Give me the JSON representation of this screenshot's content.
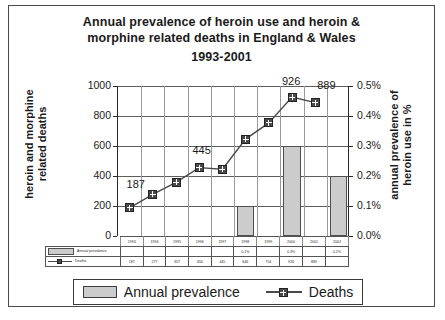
{
  "chart_data": {
    "type": "bar",
    "title": "Annual prevalence of heroin use and heroin & morphine related deaths in England & Wales 1993-2001",
    "title_lines": [
      "Annual prevalence of heroin use and heroin &",
      "morphine related deaths in England & Wales",
      "1993-2001"
    ],
    "xlabel": "",
    "categories": [
      "1993",
      "1994",
      "1995",
      "1996",
      "1997",
      "1998",
      "1999",
      "2000",
      "2001",
      "2002"
    ],
    "series": [
      {
        "name": "Annual prevalence",
        "type": "bar",
        "axis": "right",
        "unit": "%",
        "values": [
          null,
          null,
          null,
          null,
          null,
          0.1,
          null,
          0.3,
          null,
          0.2
        ],
        "labels": [
          "",
          "",
          "",
          "",
          "",
          "0.1%",
          "",
          "0.3%",
          "",
          "0.2%"
        ],
        "color": "#cccccc"
      },
      {
        "name": "Deaths",
        "type": "line",
        "axis": "left",
        "values": [
          187,
          277,
          357,
          456,
          445,
          646,
          754,
          926,
          889,
          null
        ],
        "labels": [
          "187",
          "277",
          "357",
          "456",
          "445",
          "646",
          "754",
          "926",
          "889",
          ""
        ],
        "color": "#4a4a4a"
      }
    ],
    "annotations": [
      {
        "text": "187",
        "series": "Deaths",
        "category": "1993",
        "value": 187
      },
      {
        "text": "445",
        "series": "Deaths",
        "category": "1997",
        "value": 445
      },
      {
        "text": "926",
        "series": "Deaths",
        "category": "2000",
        "value": 926
      },
      {
        "text": "889",
        "series": "Deaths",
        "category": "2001",
        "value": 889
      }
    ],
    "left_axis": {
      "ylabel": "heroin and morphine related deaths",
      "ylabel_lines": [
        "heroin and morphine",
        "related deaths"
      ],
      "ylim": [
        0,
        1000
      ],
      "ticks": [
        "1000",
        "800",
        "600",
        "400",
        "200",
        "0"
      ],
      "tick_values": [
        1000,
        800,
        600,
        400,
        200,
        0
      ]
    },
    "right_axis": {
      "ylabel": "annual prevalence of heroin use in %",
      "ylabel_lines": [
        "annual prevalence of",
        "heroin use in %"
      ],
      "ylim": [
        0,
        0.5
      ],
      "ticks": [
        "0.5%",
        "0.4%",
        "0.3%",
        "0.2%",
        "0.1%",
        "0.0%"
      ],
      "tick_values": [
        0.5,
        0.4,
        0.3,
        0.2,
        0.1,
        0.0
      ]
    },
    "grid": true,
    "legend_position": "bottom",
    "legend": [
      "Annual prevalence",
      "Deaths"
    ]
  },
  "table": {
    "years": [
      "1993",
      "1994",
      "1995",
      "1996",
      "1997",
      "1998",
      "1999",
      "2000",
      "2001",
      "2002"
    ],
    "rows": [
      {
        "label": "Annual prevalence",
        "swatch": "bar-swatch",
        "cells": [
          "",
          "",
          "",
          "",
          "",
          "0.1%",
          "",
          "0.3%",
          "",
          "0.2%"
        ]
      },
      {
        "label": "Deaths",
        "swatch": "line-swatch",
        "cells": [
          "187",
          "277",
          "357",
          "456",
          "445",
          "646",
          "754",
          "926",
          "889",
          ""
        ]
      }
    ]
  },
  "legend": {
    "prevalence_label": "Annual prevalence",
    "deaths_label": "Deaths"
  }
}
